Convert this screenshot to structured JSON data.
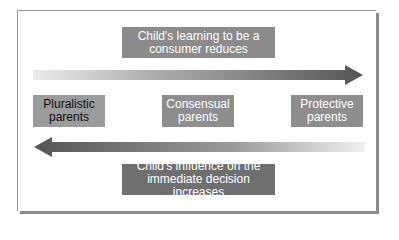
{
  "diagram": {
    "top_label": {
      "line1": "Child's learning to be a",
      "line2": "consumer reduces"
    },
    "right_arrow": {
      "direction": "right",
      "gradient_start": "#e6e6e6",
      "gradient_end": "#555555"
    },
    "parent_types": [
      {
        "line1": "Pluralistic",
        "line2": "parents"
      },
      {
        "line1": "Consensual",
        "line2": "parents"
      },
      {
        "line1": "Protective",
        "line2": "parents"
      }
    ],
    "left_arrow": {
      "direction": "left",
      "gradient_start": "#555555",
      "gradient_end": "#ececec"
    },
    "bottom_label": {
      "line1": "Child's influence on the",
      "line2": "immediate decision increases"
    },
    "colors": {
      "top_label_fill": "#8b8b8b",
      "bottom_label_fill": "#6f6f6f",
      "type_box_fill": "#8e8e8e",
      "pluralistic_fill": "#9c9c9c",
      "frame_shadow": "#8c8c8c"
    }
  }
}
